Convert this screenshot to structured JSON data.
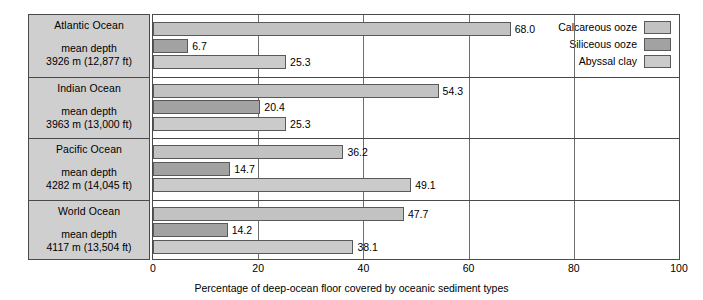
{
  "chart_data": {
    "type": "bar",
    "orientation": "horizontal",
    "title": "",
    "xlabel": "Percentage of deep-ocean floor covered by oceanic sediment types",
    "ylabel": "",
    "xlim": [
      0,
      100
    ],
    "xticks": [
      0,
      20,
      40,
      60,
      80,
      100
    ],
    "xtick_labels": [
      "0",
      "20",
      "40",
      "60",
      "80",
      "100"
    ],
    "grid": true,
    "legend_position": "inside-bottom-right",
    "categories": [
      "Atlantic Ocean",
      "Indian Ocean",
      "Pacific Ocean",
      "World Ocean"
    ],
    "series": [
      {
        "name": "Calcareous ooze",
        "color": "#c2c2c2",
        "values": [
          68.0,
          54.3,
          36.2,
          47.7
        ]
      },
      {
        "name": "Siliceous ooze",
        "color": "#a2a2a2",
        "values": [
          6.7,
          20.4,
          14.7,
          14.2
        ]
      },
      {
        "name": "Abyssal clay",
        "color": "#cbcbcb",
        "values": [
          25.3,
          25.3,
          49.1,
          38.1
        ]
      }
    ]
  },
  "row_labels": [
    {
      "ocean": "Atlantic Ocean",
      "depth_caption": "mean depth",
      "depth_value": "3926 m (12,877 ft)",
      "bar_labels": [
        "68.0",
        "6.7",
        "25.3"
      ]
    },
    {
      "ocean": "Indian Ocean",
      "depth_caption": "mean depth",
      "depth_value": "3963 m (13,000 ft)",
      "bar_labels": [
        "54.3",
        "20.4",
        "25.3"
      ]
    },
    {
      "ocean": "Pacific Ocean",
      "depth_caption": "mean depth",
      "depth_value": "4282 m (14,045 ft)",
      "bar_labels": [
        "36.2",
        "14.7",
        "49.1"
      ]
    },
    {
      "ocean": "World Ocean",
      "depth_caption": "mean depth",
      "depth_value": "4117 m (13,504 ft)",
      "bar_labels": [
        "47.7",
        "14.2",
        "38.1"
      ]
    }
  ],
  "legend": {
    "items": [
      {
        "label": "Calcareous ooze",
        "swatch": "calcareous"
      },
      {
        "label": "Siliceous ooze",
        "swatch": "siliceous"
      },
      {
        "label": "Abyssal clay",
        "swatch": "abyssal"
      }
    ]
  },
  "axis": {
    "ticks": [
      "0",
      "20",
      "40",
      "60",
      "80",
      "100"
    ],
    "title": "Percentage of deep-ocean floor covered by oceanic sediment types"
  },
  "colors": {
    "calcareous": "#c2c2c2",
    "siliceous": "#a2a2a2",
    "abyssal": "#cbcbcb",
    "panel": "#cfcfcf",
    "border": "#4a4a4a",
    "grid": "#6e6e6e"
  }
}
